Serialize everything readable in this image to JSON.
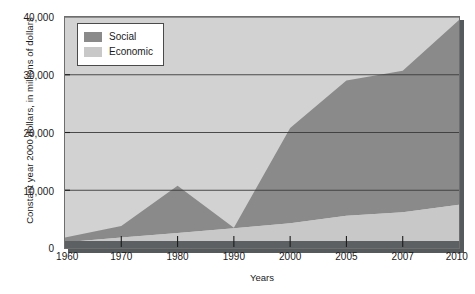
{
  "chart_data": {
    "type": "area",
    "stacked": true,
    "title": "",
    "xlabel": "Years",
    "ylabel": "Constant year 2000 dollars, in millions of dollars",
    "categories": [
      "1960",
      "1970",
      "1980",
      "1990",
      "2000",
      "2005",
      "2007",
      "2010"
    ],
    "series": [
      {
        "name": "Economic",
        "color": "#c8c8c8",
        "values": [
          1000,
          1800,
          2600,
          3400,
          4300,
          5600,
          6200,
          7500
        ]
      },
      {
        "name": "Social",
        "color": "#8a8a8a",
        "values": [
          800,
          2000,
          8200,
          100,
          16500,
          23400,
          24500,
          32000
        ]
      }
    ],
    "totals": [
      1800,
      3800,
      10800,
      3500,
      20800,
      29000,
      30700,
      39500
    ],
    "ylim": [
      0,
      40000
    ],
    "yticks": [
      0,
      10000,
      20000,
      30000,
      40000
    ],
    "ytick_labels": [
      "0",
      "10,000",
      "20,000",
      "30,000",
      "40,000"
    ],
    "grid": "horizontal",
    "legend_position": "top-left-inside",
    "plot_background": "#d2d2d2"
  },
  "legend": {
    "items": [
      {
        "label": "Social",
        "color": "#8a8a8a"
      },
      {
        "label": "Economic",
        "color": "#c8c8c8"
      }
    ]
  }
}
